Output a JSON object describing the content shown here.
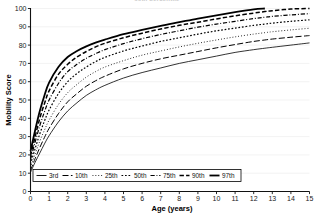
{
  "chart_data": {
    "type": "line",
    "title": "66th percentile",
    "xlabel": "Age (years)",
    "ylabel": "Mobility Score",
    "xlim": [
      0,
      15
    ],
    "ylim": [
      0,
      100
    ],
    "xticks": [
      "0",
      "1",
      "2",
      "3",
      "4",
      "5",
      "6",
      "7",
      "8",
      "9",
      "10",
      "11",
      "12",
      "13",
      "14",
      "15"
    ],
    "yticks": [
      "0",
      "10",
      "20",
      "30",
      "40",
      "50",
      "60",
      "70",
      "80",
      "90",
      "100"
    ],
    "grid": true,
    "legend_position": "bottom-left-inside",
    "x": [
      0,
      0.25,
      0.5,
      0.75,
      1,
      1.5,
      2,
      2.5,
      3,
      3.5,
      4,
      5,
      6,
      7,
      8,
      9,
      10,
      11,
      12,
      12.6,
      13,
      14,
      15
    ],
    "series": [
      {
        "name": "3rd",
        "dash": "solid-thin",
        "width": 0.8,
        "values": [
          10.5,
          16,
          21,
          26,
          30.5,
          38,
          44,
          48.5,
          52.5,
          55.5,
          58,
          62,
          65,
          67.5,
          70,
          72,
          74,
          76,
          77.5,
          78.3,
          78.8,
          80,
          81.2
        ]
      },
      {
        "name": "10th",
        "dash": "dash-long",
        "width": 1.0,
        "values": [
          11.5,
          18,
          24,
          29.5,
          34.5,
          42.5,
          49,
          53.5,
          57.5,
          60.5,
          63,
          67,
          70,
          72.5,
          74.5,
          76.5,
          78.5,
          80.3,
          82,
          82.8,
          83.3,
          84.3,
          85.2
        ]
      },
      {
        "name": "25th",
        "dash": "dot-fine",
        "width": 0.9,
        "values": [
          13,
          20.5,
          27.5,
          33.5,
          39,
          47.5,
          54,
          58.5,
          62.5,
          65.5,
          68,
          71.5,
          74.5,
          76.8,
          79,
          81,
          82.8,
          84.5,
          86,
          86.8,
          87.3,
          88.3,
          89.2
        ]
      },
      {
        "name": "50th",
        "dash": "dot-square",
        "width": 1.2,
        "values": [
          15,
          23.5,
          31.5,
          38.5,
          44.5,
          53.5,
          60,
          64.5,
          68,
          71,
          73.3,
          76.8,
          79.5,
          82,
          84,
          86,
          87.8,
          89.3,
          90.8,
          91.5,
          92,
          93,
          93.8
        ]
      },
      {
        "name": "75th",
        "dash": "dash-dot",
        "width": 1.2,
        "values": [
          17.5,
          27,
          36,
          43.5,
          50,
          59,
          65.5,
          69.5,
          72.8,
          75.3,
          77.5,
          80.8,
          83.5,
          85.8,
          87.8,
          89.8,
          91.5,
          93,
          94.5,
          95.2,
          95.7,
          96.5,
          97.2
        ]
      },
      {
        "name": "90th",
        "dash": "dash-med",
        "width": 1.5,
        "values": [
          19.5,
          30,
          40,
          48,
          55,
          64,
          69.5,
          73.5,
          76.5,
          79,
          81,
          84,
          86.5,
          88.8,
          90.8,
          92.5,
          94.3,
          96,
          97.5,
          98.3,
          98.8,
          99.7,
          100
        ]
      },
      {
        "name": "97th",
        "dash": "solid-thick",
        "width": 1.8,
        "values": [
          22,
          33.5,
          44,
          52.5,
          59.5,
          68,
          73.5,
          76.8,
          79.3,
          81.3,
          83,
          86,
          88.3,
          90.5,
          92.5,
          94.5,
          96.3,
          98,
          99.5,
          100,
          null,
          null,
          null
        ]
      }
    ]
  },
  "legend": {
    "entries": [
      {
        "label": "3rd"
      },
      {
        "label": "10th"
      },
      {
        "label": "25th"
      },
      {
        "label": "50th"
      },
      {
        "label": "75th"
      },
      {
        "label": "90th"
      },
      {
        "label": "97th"
      }
    ]
  }
}
